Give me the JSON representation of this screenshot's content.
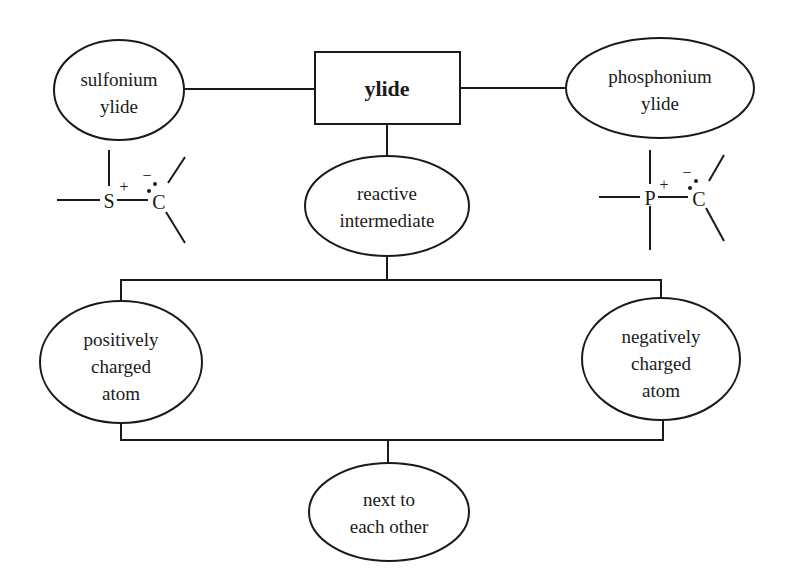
{
  "diagram": {
    "central": {
      "label": "ylide"
    },
    "sulfonium": {
      "line1": "sulfonium",
      "line2": "ylide"
    },
    "phosphonium": {
      "line1": "phosphonium",
      "line2": "ylide"
    },
    "reactive": {
      "line1": "reactive",
      "line2": "intermediate"
    },
    "positive": {
      "line1": "positively",
      "line2": "charged",
      "line3": "atom"
    },
    "negative": {
      "line1": "negatively",
      "line2": "charged",
      "line3": "atom"
    },
    "adjacent": {
      "line1": "next to",
      "line2": "each other"
    },
    "sulfonium_structure": {
      "hetero_atom": "S",
      "carbon": "C",
      "plus": "+",
      "minus": "−"
    },
    "phosphonium_structure": {
      "hetero_atom": "P",
      "carbon": "C",
      "plus": "+",
      "minus": "−"
    }
  }
}
